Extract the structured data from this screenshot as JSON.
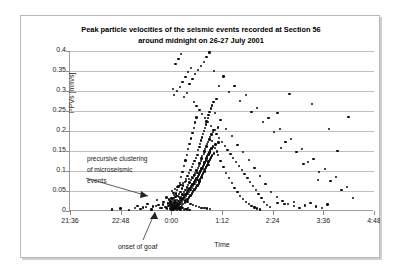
{
  "chart_data": {
    "type": "scatter",
    "title": "Peak particle velocities of the seismic events recorded at Section 56 around midnight on 26-27  July 2001",
    "title_line1": "Peak particle velocities of the seismic events recorded at Section 56",
    "title_line2": "around midnight on 26-27  July 2001",
    "xlabel": "Time",
    "ylabel": "PPVs [mm/s]",
    "grid": true,
    "legend": "none",
    "ylim": [
      0,
      0.4
    ],
    "yticks": [
      "0",
      "0.05",
      "0.1",
      "0.15",
      "0.2",
      "0.25",
      "0.3",
      "0.35",
      "0.4"
    ],
    "ytick_values": [
      0,
      0.05,
      0.1,
      0.15,
      0.2,
      0.25,
      0.3,
      0.35,
      0.4
    ],
    "xlim_minutes": [
      0,
      432
    ],
    "xticks": [
      "21:36",
      "22:48",
      "0:00",
      "1:12",
      "2:24",
      "3:36",
      "4:48"
    ],
    "xtick_minutes": [
      0,
      72,
      144,
      216,
      288,
      360,
      432
    ],
    "annotations": [
      {
        "name": "precursive-clustering",
        "text": "precursive clustering of microseismic events",
        "lines": [
          "precursive clustering",
          "of microseismic",
          "events"
        ]
      },
      {
        "name": "onset-of-goaf",
        "text": "onset of goaf"
      }
    ],
    "marker": {
      "shape": "circle",
      "color": "#0b0b0b",
      "size": 2.4
    },
    "points": [
      [
        96,
        0.012
      ],
      [
        104,
        0.009
      ],
      [
        110,
        0.018
      ],
      [
        118,
        0.011
      ],
      [
        124,
        0.027
      ],
      [
        126,
        0.015
      ],
      [
        130,
        0.008
      ],
      [
        133,
        0.022
      ],
      [
        135,
        0.01
      ],
      [
        137,
        0.034
      ],
      [
        138,
        0.006
      ],
      [
        139,
        0.019
      ],
      [
        140,
        0.012
      ],
      [
        141,
        0.029
      ],
      [
        142,
        0.007
      ],
      [
        142,
        0.016
      ],
      [
        143,
        0.024
      ],
      [
        143,
        0.005
      ],
      [
        144,
        0.011
      ],
      [
        144,
        0.018
      ],
      [
        144,
        0.031
      ],
      [
        145,
        0.009
      ],
      [
        145,
        0.022
      ],
      [
        145,
        0.014
      ],
      [
        146,
        0.006
      ],
      [
        146,
        0.027
      ],
      [
        146,
        0.017
      ],
      [
        147,
        0.012
      ],
      [
        147,
        0.033
      ],
      [
        147,
        0.008
      ],
      [
        148,
        0.021
      ],
      [
        148,
        0.015
      ],
      [
        148,
        0.04
      ],
      [
        149,
        0.01
      ],
      [
        149,
        0.026
      ],
      [
        149,
        0.019
      ],
      [
        150,
        0.007
      ],
      [
        150,
        0.035
      ],
      [
        150,
        0.013
      ],
      [
        150,
        0.023
      ],
      [
        151,
        0.009
      ],
      [
        151,
        0.044
      ],
      [
        151,
        0.017
      ],
      [
        152,
        0.028
      ],
      [
        152,
        0.011
      ],
      [
        152,
        0.052
      ],
      [
        153,
        0.02
      ],
      [
        153,
        0.014
      ],
      [
        153,
        0.037
      ],
      [
        154,
        0.008
      ],
      [
        154,
        0.025
      ],
      [
        154,
        0.061
      ],
      [
        155,
        0.016
      ],
      [
        155,
        0.042
      ],
      [
        155,
        0.012
      ],
      [
        156,
        0.031
      ],
      [
        156,
        0.021
      ],
      [
        156,
        0.07
      ],
      [
        157,
        0.009
      ],
      [
        157,
        0.048
      ],
      [
        157,
        0.018
      ],
      [
        158,
        0.035
      ],
      [
        158,
        0.026
      ],
      [
        158,
        0.085
      ],
      [
        159,
        0.013
      ],
      [
        159,
        0.056
      ],
      [
        159,
        0.023
      ],
      [
        160,
        0.041
      ],
      [
        160,
        0.031
      ],
      [
        160,
        0.098
      ],
      [
        161,
        0.017
      ],
      [
        161,
        0.064
      ],
      [
        161,
        0.028
      ],
      [
        162,
        0.047
      ],
      [
        162,
        0.036
      ],
      [
        162,
        0.112
      ],
      [
        163,
        0.021
      ],
      [
        163,
        0.072
      ],
      [
        163,
        0.033
      ],
      [
        164,
        0.053
      ],
      [
        164,
        0.041
      ],
      [
        164,
        0.126
      ],
      [
        165,
        0.025
      ],
      [
        165,
        0.08
      ],
      [
        165,
        0.038
      ],
      [
        166,
        0.059
      ],
      [
        166,
        0.046
      ],
      [
        166,
        0.14
      ],
      [
        167,
        0.029
      ],
      [
        167,
        0.088
      ],
      [
        167,
        0.043
      ],
      [
        168,
        0.065
      ],
      [
        168,
        0.051
      ],
      [
        168,
        0.155
      ],
      [
        169,
        0.034
      ],
      [
        169,
        0.095
      ],
      [
        169,
        0.048
      ],
      [
        170,
        0.071
      ],
      [
        170,
        0.056
      ],
      [
        170,
        0.168
      ],
      [
        171,
        0.039
      ],
      [
        171,
        0.103
      ],
      [
        171,
        0.053
      ],
      [
        172,
        0.077
      ],
      [
        172,
        0.061
      ],
      [
        172,
        0.181
      ],
      [
        173,
        0.044
      ],
      [
        173,
        0.11
      ],
      [
        173,
        0.058
      ],
      [
        174,
        0.083
      ],
      [
        174,
        0.066
      ],
      [
        174,
        0.195
      ],
      [
        175,
        0.049
      ],
      [
        175,
        0.118
      ],
      [
        175,
        0.063
      ],
      [
        176,
        0.089
      ],
      [
        176,
        0.071
      ],
      [
        176,
        0.208
      ],
      [
        177,
        0.054
      ],
      [
        177,
        0.125
      ],
      [
        177,
        0.068
      ],
      [
        178,
        0.095
      ],
      [
        178,
        0.076
      ],
      [
        178,
        0.221
      ],
      [
        179,
        0.059
      ],
      [
        179,
        0.133
      ],
      [
        179,
        0.073
      ],
      [
        180,
        0.101
      ],
      [
        180,
        0.081
      ],
      [
        180,
        0.234
      ],
      [
        181,
        0.064
      ],
      [
        181,
        0.14
      ],
      [
        181,
        0.078
      ],
      [
        182,
        0.107
      ],
      [
        182,
        0.086
      ],
      [
        182,
        0.152
      ],
      [
        183,
        0.069
      ],
      [
        183,
        0.113
      ],
      [
        183,
        0.091
      ],
      [
        184,
        0.16
      ],
      [
        184,
        0.074
      ],
      [
        184,
        0.119
      ],
      [
        185,
        0.096
      ],
      [
        185,
        0.168
      ],
      [
        185,
        0.079
      ],
      [
        186,
        0.125
      ],
      [
        186,
        0.101
      ],
      [
        186,
        0.176
      ],
      [
        187,
        0.084
      ],
      [
        187,
        0.131
      ],
      [
        187,
        0.106
      ],
      [
        188,
        0.184
      ],
      [
        188,
        0.089
      ],
      [
        188,
        0.137
      ],
      [
        189,
        0.111
      ],
      [
        189,
        0.192
      ],
      [
        189,
        0.094
      ],
      [
        190,
        0.143
      ],
      [
        190,
        0.116
      ],
      [
        190,
        0.2
      ],
      [
        191,
        0.099
      ],
      [
        191,
        0.149
      ],
      [
        191,
        0.121
      ],
      [
        192,
        0.208
      ],
      [
        192,
        0.104
      ],
      [
        192,
        0.155
      ],
      [
        193,
        0.126
      ],
      [
        193,
        0.216
      ],
      [
        193,
        0.109
      ],
      [
        194,
        0.161
      ],
      [
        194,
        0.131
      ],
      [
        194,
        0.224
      ],
      [
        195,
        0.114
      ],
      [
        195,
        0.167
      ],
      [
        195,
        0.136
      ],
      [
        196,
        0.232
      ],
      [
        196,
        0.119
      ],
      [
        196,
        0.173
      ],
      [
        197,
        0.141
      ],
      [
        197,
        0.24
      ],
      [
        197,
        0.124
      ],
      [
        198,
        0.179
      ],
      [
        198,
        0.146
      ],
      [
        198,
        0.248
      ],
      [
        199,
        0.129
      ],
      [
        199,
        0.185
      ],
      [
        199,
        0.151
      ],
      [
        200,
        0.256
      ],
      [
        200,
        0.134
      ],
      [
        201,
        0.191
      ],
      [
        201,
        0.156
      ],
      [
        202,
        0.264
      ],
      [
        202,
        0.139
      ],
      [
        203,
        0.197
      ],
      [
        203,
        0.161
      ],
      [
        204,
        0.272
      ],
      [
        205,
        0.144
      ],
      [
        206,
        0.203
      ],
      [
        207,
        0.166
      ],
      [
        208,
        0.28
      ],
      [
        209,
        0.149
      ],
      [
        210,
        0.209
      ],
      [
        211,
        0.171
      ],
      [
        148,
        0.29
      ],
      [
        152,
        0.3
      ],
      [
        156,
        0.31
      ],
      [
        160,
        0.322
      ],
      [
        164,
        0.335
      ],
      [
        168,
        0.347
      ],
      [
        172,
        0.358
      ],
      [
        150,
        0.368
      ],
      [
        154,
        0.38
      ],
      [
        158,
        0.392
      ],
      [
        146,
        0.305
      ],
      [
        162,
        0.285
      ],
      [
        166,
        0.295
      ],
      [
        170,
        0.318
      ],
      [
        174,
        0.33
      ],
      [
        178,
        0.342
      ],
      [
        182,
        0.352
      ],
      [
        186,
        0.363
      ],
      [
        190,
        0.372
      ],
      [
        194,
        0.385
      ],
      [
        198,
        0.396
      ],
      [
        176,
        0.272
      ],
      [
        180,
        0.262
      ],
      [
        184,
        0.252
      ],
      [
        188,
        0.242
      ],
      [
        192,
        0.232
      ],
      [
        196,
        0.222
      ],
      [
        200,
        0.212
      ],
      [
        204,
        0.202
      ],
      [
        208,
        0.192
      ],
      [
        212,
        0.182
      ],
      [
        216,
        0.172
      ],
      [
        220,
        0.162
      ],
      [
        224,
        0.152
      ],
      [
        228,
        0.142
      ],
      [
        232,
        0.132
      ],
      [
        236,
        0.122
      ],
      [
        240,
        0.112
      ],
      [
        244,
        0.102
      ],
      [
        248,
        0.092
      ],
      [
        252,
        0.082
      ],
      [
        256,
        0.072
      ],
      [
        260,
        0.062
      ],
      [
        264,
        0.052
      ],
      [
        268,
        0.042
      ],
      [
        272,
        0.032
      ],
      [
        276,
        0.022
      ],
      [
        280,
        0.015
      ],
      [
        284,
        0.01
      ],
      [
        206,
        0.245
      ],
      [
        214,
        0.228
      ],
      [
        222,
        0.205
      ],
      [
        230,
        0.188
      ],
      [
        238,
        0.165
      ],
      [
        246,
        0.148
      ],
      [
        254,
        0.128
      ],
      [
        262,
        0.108
      ],
      [
        270,
        0.088
      ],
      [
        278,
        0.068
      ],
      [
        286,
        0.048
      ],
      [
        294,
        0.035
      ],
      [
        302,
        0.025
      ],
      [
        310,
        0.018
      ],
      [
        318,
        0.012
      ],
      [
        326,
        0.008
      ],
      [
        334,
        0.014
      ],
      [
        342,
        0.02
      ],
      [
        350,
        0.011
      ],
      [
        358,
        0.007
      ],
      [
        366,
        0.016
      ],
      [
        205,
        0.35
      ],
      [
        218,
        0.336
      ],
      [
        234,
        0.312
      ],
      [
        250,
        0.29
      ],
      [
        266,
        0.258
      ],
      [
        282,
        0.232
      ],
      [
        298,
        0.205
      ],
      [
        314,
        0.18
      ],
      [
        330,
        0.155
      ],
      [
        346,
        0.13
      ],
      [
        362,
        0.105
      ],
      [
        378,
        0.085
      ],
      [
        394,
        0.06
      ],
      [
        212,
        0.312
      ],
      [
        226,
        0.298
      ],
      [
        242,
        0.275
      ],
      [
        258,
        0.248
      ],
      [
        274,
        0.222
      ],
      [
        290,
        0.198
      ],
      [
        306,
        0.172
      ],
      [
        322,
        0.148
      ],
      [
        338,
        0.122
      ],
      [
        354,
        0.098
      ],
      [
        370,
        0.075
      ],
      [
        386,
        0.052
      ],
      [
        402,
        0.032
      ],
      [
        145,
        0.05
      ],
      [
        147,
        0.045
      ],
      [
        149,
        0.055
      ],
      [
        151,
        0.04
      ],
      [
        153,
        0.06
      ],
      [
        155,
        0.035
      ],
      [
        157,
        0.065
      ],
      [
        159,
        0.03
      ],
      [
        161,
        0.07
      ],
      [
        163,
        0.026
      ],
      [
        165,
        0.075
      ],
      [
        167,
        0.022
      ],
      [
        169,
        0.08
      ],
      [
        171,
        0.018
      ],
      [
        173,
        0.085
      ],
      [
        175,
        0.015
      ],
      [
        177,
        0.09
      ],
      [
        179,
        0.012
      ],
      [
        181,
        0.095
      ],
      [
        183,
        0.01
      ],
      [
        185,
        0.1
      ],
      [
        187,
        0.008
      ],
      [
        189,
        0.105
      ],
      [
        191,
        0.007
      ],
      [
        193,
        0.11
      ],
      [
        195,
        0.006
      ],
      [
        197,
        0.115
      ],
      [
        199,
        0.005
      ],
      [
        144,
        0.003
      ],
      [
        146,
        0.004
      ],
      [
        148,
        0.002
      ],
      [
        150,
        0.005
      ],
      [
        152,
        0.003
      ],
      [
        154,
        0.006
      ],
      [
        156,
        0.004
      ],
      [
        158,
        0.002
      ],
      [
        160,
        0.007
      ],
      [
        162,
        0.003
      ],
      [
        164,
        0.005
      ],
      [
        166,
        0.004
      ],
      [
        168,
        0.008
      ],
      [
        170,
        0.003
      ],
      [
        60,
        0.004
      ],
      [
        72,
        0.006
      ],
      [
        84,
        0.003
      ],
      [
        92,
        0.008
      ],
      [
        100,
        0.005
      ],
      [
        108,
        0.01
      ],
      [
        116,
        0.004
      ],
      [
        122,
        0.013
      ],
      [
        128,
        0.007
      ],
      [
        132,
        0.016
      ],
      [
        136,
        0.009
      ],
      [
        140,
        0.02
      ],
      [
        202,
        0.175
      ],
      [
        206,
        0.158
      ],
      [
        210,
        0.14
      ],
      [
        214,
        0.125
      ],
      [
        218,
        0.11
      ],
      [
        222,
        0.095
      ],
      [
        226,
        0.082
      ],
      [
        230,
        0.07
      ],
      [
        234,
        0.058
      ],
      [
        238,
        0.048
      ],
      [
        242,
        0.038
      ],
      [
        246,
        0.03
      ],
      [
        250,
        0.023
      ],
      [
        254,
        0.017
      ],
      [
        258,
        0.013
      ],
      [
        262,
        0.009
      ],
      [
        266,
        0.006
      ],
      [
        270,
        0.004
      ],
      [
        295,
        0.245
      ],
      [
        312,
        0.292
      ],
      [
        344,
        0.268
      ],
      [
        368,
        0.205
      ],
      [
        300,
        0.158
      ],
      [
        332,
        0.118
      ],
      [
        352,
        0.078
      ],
      [
        295,
        0.02
      ],
      [
        305,
        0.018
      ],
      [
        318,
        0.022
      ],
      [
        380,
        0.15
      ],
      [
        396,
        0.235
      ]
    ]
  }
}
